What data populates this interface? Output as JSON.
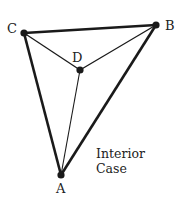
{
  "diagram": {
    "caption": [
      "Interior",
      "Case"
    ],
    "vertices": {
      "A": {
        "label": "A",
        "x": 61,
        "y": 175
      },
      "B": {
        "label": "B",
        "x": 156,
        "y": 25
      },
      "C": {
        "label": "C",
        "x": 24,
        "y": 33
      },
      "D": {
        "label": "D",
        "x": 80,
        "y": 70
      }
    },
    "edges": [
      {
        "from": "C",
        "to": "B",
        "weight": "thick"
      },
      {
        "from": "C",
        "to": "A",
        "weight": "thick"
      },
      {
        "from": "B",
        "to": "A",
        "weight": "thick"
      },
      {
        "from": "C",
        "to": "D",
        "weight": "thin"
      },
      {
        "from": "B",
        "to": "D",
        "weight": "thin"
      },
      {
        "from": "A",
        "to": "D",
        "weight": "thin"
      }
    ],
    "colors": {
      "stroke": "#1a1a1a",
      "background": "#ffffff"
    }
  }
}
